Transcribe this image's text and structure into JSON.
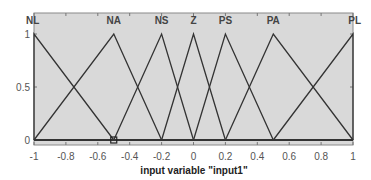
{
  "chart_data": {
    "type": "line",
    "title": "",
    "xlabel": "input variable \"input1\"",
    "ylabel": "",
    "xlim": [
      -1,
      1
    ],
    "ylim": [
      0,
      1
    ],
    "grid": false,
    "xticks": [
      -1,
      -0.8,
      -0.6,
      -0.4,
      -0.2,
      0,
      0.2,
      0.4,
      0.6,
      0.8,
      1
    ],
    "xtick_labels": [
      "-1",
      "-0.8",
      "-0.6",
      "-0.4",
      "-0.2",
      "0",
      "0.2",
      "0.4",
      "0.6",
      "0.8",
      "1"
    ],
    "yticks": [
      0,
      0.5,
      1
    ],
    "ytick_labels": [
      "0",
      "0.5",
      "1"
    ],
    "series": [
      {
        "name": "NL",
        "shape": "trimf",
        "params": [
          -1,
          -1,
          -0.5
        ],
        "x": [
          -1,
          -1,
          -0.5
        ],
        "y": [
          0,
          1,
          0
        ]
      },
      {
        "name": "NA",
        "shape": "trimf",
        "params": [
          -1,
          -0.5,
          -0.2
        ],
        "x": [
          -1,
          -0.5,
          -0.2
        ],
        "y": [
          0,
          1,
          0
        ]
      },
      {
        "name": "NS",
        "shape": "trimf",
        "params": [
          -0.5,
          -0.2,
          0
        ],
        "x": [
          -0.5,
          -0.2,
          0
        ],
        "y": [
          0,
          1,
          0
        ]
      },
      {
        "name": "Z",
        "shape": "trimf",
        "params": [
          -0.2,
          0,
          0.2
        ],
        "x": [
          -0.2,
          0,
          0.2
        ],
        "y": [
          0,
          1,
          0
        ]
      },
      {
        "name": "PS",
        "shape": "trimf",
        "params": [
          0,
          0.2,
          0.5
        ],
        "x": [
          0,
          0.2,
          0.5
        ],
        "y": [
          0,
          1,
          0
        ]
      },
      {
        "name": "PA",
        "shape": "trimf",
        "params": [
          0.2,
          0.5,
          1
        ],
        "x": [
          0.2,
          0.5,
          1
        ],
        "y": [
          0,
          1,
          0
        ]
      },
      {
        "name": "PL",
        "shape": "trimf",
        "params": [
          0.5,
          1,
          1
        ],
        "x": [
          0.5,
          1,
          1
        ],
        "y": [
          0,
          1,
          0
        ]
      }
    ],
    "marker": {
      "x": -0.5,
      "y": 0,
      "shape": "square"
    }
  },
  "colors": {
    "plot_background": "#d9d9d9",
    "line": "#333333",
    "axis": "#666666"
  }
}
